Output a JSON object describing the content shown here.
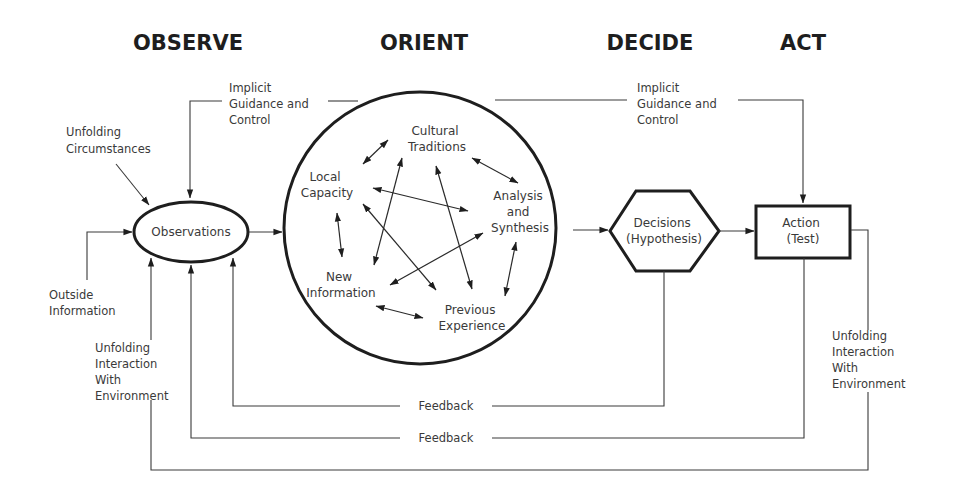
{
  "diagram": {
    "type": "OODA loop",
    "phases": [
      {
        "id": "observe",
        "label": "OBSERVE"
      },
      {
        "id": "orient",
        "label": "ORIENT"
      },
      {
        "id": "decide",
        "label": "DECIDE"
      },
      {
        "id": "act",
        "label": "ACT"
      }
    ],
    "nodes": {
      "observations": {
        "label": "Observations"
      },
      "decisions": {
        "line1": "Decisions",
        "line2": "(Hypothesis)"
      },
      "action": {
        "line1": "Action",
        "line2": "(Test)"
      }
    },
    "orient_elements": {
      "cultural_traditions": {
        "line1": "Cultural",
        "line2": "Traditions"
      },
      "analysis_synthesis": {
        "line1": "Analysis",
        "line2": "and",
        "line3": "Synthesis"
      },
      "previous_experience": {
        "line1": "Previous",
        "line2": "Experience"
      },
      "new_information": {
        "line1": "New",
        "line2": "Information"
      },
      "local_capacity": {
        "line1": "Local",
        "line2": "Capacity"
      }
    },
    "labels": {
      "implicit_left": {
        "line1": "Implicit",
        "line2": "Guidance and",
        "line3": "Control"
      },
      "implicit_right": {
        "line1": "Implicit",
        "line2": "Guidance and",
        "line3": "Control"
      },
      "unfolding_circumstances": {
        "line1": "Unfolding",
        "line2": "Circumstances"
      },
      "outside_information": {
        "line1": "Outside",
        "line2": "Information"
      },
      "unfolding_interaction_left": {
        "line1": "Unfolding",
        "line2": "Interaction",
        "line3": "With",
        "line4": "Environment"
      },
      "unfolding_interaction_right": {
        "line1": "Unfolding",
        "line2": "Interaction",
        "line3": "With",
        "line4": "Environment"
      },
      "feedback_1": "Feedback",
      "feedback_2": "Feedback"
    },
    "edges": [
      {
        "from": "Unfolding Circumstances",
        "to": "Observations"
      },
      {
        "from": "Outside Information",
        "to": "Observations"
      },
      {
        "from": "Observations",
        "to": "Orient"
      },
      {
        "from": "Orient",
        "to": "Decisions",
        "via": "Analysis and Synthesis"
      },
      {
        "from": "Decisions",
        "to": "Action"
      },
      {
        "from": "Orient",
        "to": "Observations",
        "label": "Implicit Guidance and Control"
      },
      {
        "from": "Orient",
        "to": "Action",
        "label": "Implicit Guidance and Control"
      },
      {
        "from": "Decisions",
        "to": "Observations",
        "label": "Feedback"
      },
      {
        "from": "Action",
        "to": "Observations",
        "label": "Feedback"
      },
      {
        "from": "Action",
        "to": "Observations",
        "label": "Unfolding Interaction With Environment"
      }
    ]
  }
}
